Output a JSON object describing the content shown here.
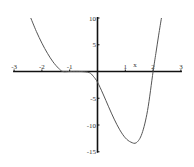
{
  "chart_data": {
    "type": "line",
    "title": "",
    "xlabel": "x",
    "ylabel": "",
    "xlim": [
      -3,
      3
    ],
    "ylim": [
      -15,
      10
    ],
    "grid": false,
    "legend": null,
    "x_ticks": [
      -3,
      -2,
      -1,
      1,
      2,
      3
    ],
    "x_tick_labels": [
      "-3",
      "-2",
      "-1",
      "1",
      "x",
      "2",
      "3"
    ],
    "y_ticks": [
      10,
      5,
      -5,
      -10,
      -15
    ],
    "y_tick_labels": [
      "10",
      "5",
      "-5",
      "-10",
      "-15"
    ],
    "series": [
      {
        "name": "f(x)",
        "color": "#555555",
        "x": [
          -2.4,
          -2.2,
          -2.0,
          -1.8,
          -1.6,
          -1.4,
          -1.25,
          -1.0,
          -0.6,
          -0.3,
          -0.15,
          0.0,
          0.2,
          0.4,
          0.6,
          0.8,
          1.0,
          1.2,
          1.4,
          1.6,
          1.8,
          2.0,
          2.1,
          2.2,
          2.3
        ],
        "y": [
          10.0,
          7.5,
          5.3,
          3.4,
          1.8,
          0.6,
          0.0,
          0.0,
          0.0,
          -0.2,
          -0.9,
          -2.0,
          -4.2,
          -6.6,
          -8.9,
          -10.9,
          -12.4,
          -13.2,
          -13.3,
          -11.6,
          -7.3,
          0.0,
          3.4,
          6.8,
          10.0
        ]
      }
    ],
    "annotations": [
      {
        "text": "x",
        "x": 1.5,
        "y": 0.9
      }
    ]
  },
  "axes": {
    "x_label": "x",
    "x_ticks": [
      {
        "value": -3,
        "label": "-3"
      },
      {
        "value": -2,
        "label": "-2"
      },
      {
        "value": -1,
        "label": "-1"
      },
      {
        "value": 1,
        "label": "1"
      },
      {
        "value": 2,
        "label": "2"
      },
      {
        "value": 3,
        "label": "3"
      }
    ],
    "y_ticks": [
      {
        "value": 10,
        "label": "10"
      },
      {
        "value": 5,
        "label": "5"
      },
      {
        "value": -5,
        "label": "-5"
      },
      {
        "value": -10,
        "label": "-10"
      },
      {
        "value": -15,
        "label": "-15"
      }
    ]
  }
}
